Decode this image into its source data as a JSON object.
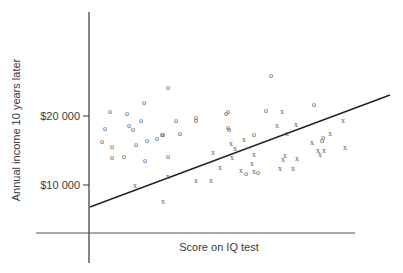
{
  "chart_data": {
    "type": "scatter",
    "title": "",
    "xlabel": "Score on IQ test",
    "ylabel": "Annual income 10 years later",
    "y_ticks": [
      {
        "label": "$20 000",
        "value": 20000
      },
      {
        "label": "$10 000",
        "value": 10000
      }
    ],
    "x_ticks": [],
    "grid": false,
    "legend": null,
    "ylim": [
      3500,
      37000
    ],
    "series": [
      {
        "name": "O",
        "marker": "o",
        "points_px": [
          [
            110,
            111
          ],
          [
            127,
            113
          ],
          [
            144,
            102
          ],
          [
            168,
            87
          ],
          [
            136,
            144
          ],
          [
            105,
            128
          ],
          [
            129,
            125
          ],
          [
            141,
            120
          ],
          [
            176,
            120
          ],
          [
            196,
            120
          ],
          [
            102,
            141
          ],
          [
            112,
            146
          ],
          [
            133,
            129
          ],
          [
            147,
            140
          ],
          [
            163,
            134
          ],
          [
            180,
            133
          ],
          [
            162,
            134
          ],
          [
            157,
            138
          ],
          [
            112,
            157
          ],
          [
            124,
            156
          ],
          [
            145,
            160
          ],
          [
            168,
            156
          ],
          [
            228,
            111
          ],
          [
            229,
            129
          ],
          [
            228,
            127
          ],
          [
            196,
            117
          ],
          [
            226,
            113
          ],
          [
            254,
            134
          ],
          [
            271,
            75
          ],
          [
            266,
            110
          ],
          [
            258,
            172
          ],
          [
            314,
            104
          ],
          [
            322,
            140
          ],
          [
            246,
            173
          ],
          [
            323,
            137
          ]
        ]
      },
      {
        "name": "X",
        "marker": "x",
        "points_px": [
          [
            135,
            185
          ],
          [
            168,
            176
          ],
          [
            163,
            201
          ],
          [
            196,
            180
          ],
          [
            211,
            180
          ],
          [
            213,
            152
          ],
          [
            231,
            143
          ],
          [
            235,
            148
          ],
          [
            220,
            167
          ],
          [
            244,
            139
          ],
          [
            232,
            157
          ],
          [
            254,
            154
          ],
          [
            252,
            163
          ],
          [
            241,
            170
          ],
          [
            254,
            171
          ],
          [
            282,
            111
          ],
          [
            287,
            133
          ],
          [
            296,
            124
          ],
          [
            277,
            125
          ],
          [
            285,
            155
          ],
          [
            283,
            159
          ],
          [
            297,
            158
          ],
          [
            280,
            168
          ],
          [
            293,
            168
          ],
          [
            318,
            150
          ],
          [
            330,
            133
          ],
          [
            312,
            142
          ],
          [
            343,
            120
          ],
          [
            345,
            147
          ],
          [
            320,
            154
          ],
          [
            324,
            150
          ]
        ]
      }
    ],
    "trend_line": {
      "from_px": [
        90,
        207
      ],
      "to_px": [
        390,
        95
      ],
      "label": "regression line"
    }
  }
}
